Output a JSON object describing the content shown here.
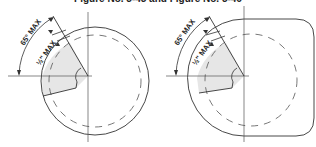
{
  "title": "Figure No. 5-45 and Figure No. 5-46",
  "colors": {
    "stroke": "#333333",
    "wedge_fill": "#e6e6e6",
    "background": "#ffffff"
  },
  "figures": [
    {
      "id": "figure-5-45",
      "shape": "circle",
      "angle_label": "65° MAX",
      "offset_label": "½\" MAX"
    },
    {
      "id": "figure-5-46",
      "shape": "rounded-square-with-circular-corner",
      "angle_label": "65° MAX",
      "offset_label": "½\" MAX"
    }
  ]
}
